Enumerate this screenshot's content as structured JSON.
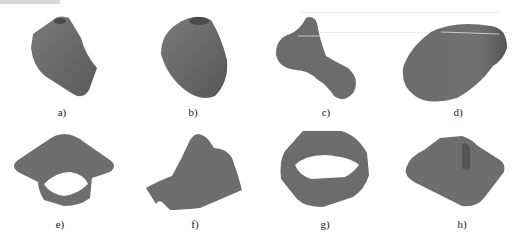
{
  "figure": {
    "panels": [
      {
        "id": "a",
        "label": "a)"
      },
      {
        "id": "b",
        "label": "b)"
      },
      {
        "id": "c",
        "label": "c)"
      },
      {
        "id": "d",
        "label": "d)"
      },
      {
        "id": "e",
        "label": "e)"
      },
      {
        "id": "f",
        "label": "f)"
      },
      {
        "id": "g",
        "label": "g)"
      },
      {
        "id": "h",
        "label": "h)"
      }
    ],
    "colors": {
      "shape_fill": "#6e6e6e",
      "shape_dark": "#4e4e4e",
      "shape_light": "#8a8a8a",
      "background": "#ffffff"
    }
  }
}
